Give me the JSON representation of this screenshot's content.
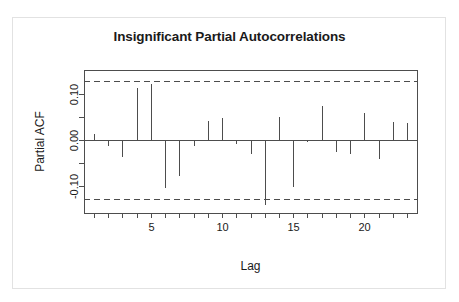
{
  "figure": {
    "background_color": "#ffffff",
    "frame_color": "#e2e2e2",
    "line_color": "#4d4d4d",
    "text_color": "#1a1a1a"
  },
  "chart_data": {
    "type": "bar",
    "title": "Insignificant Partial Autocorrelations",
    "xlabel": "Lag",
    "ylabel": "Partial ACF",
    "xlim": [
      0.3,
      23.7
    ],
    "ylim": [
      -0.158,
      0.152
    ],
    "grid": false,
    "legend": null,
    "x_ticks": [
      5,
      10,
      15,
      20
    ],
    "x_tick_labels": [
      "5",
      "10",
      "15",
      "20"
    ],
    "x_minor_ticks": [
      1,
      2,
      3,
      4,
      6,
      7,
      8,
      9,
      11,
      12,
      13,
      14,
      16,
      17,
      18,
      19,
      21,
      22,
      23
    ],
    "y_ticks": [
      -0.1,
      0.0,
      0.1
    ],
    "y_tick_labels": [
      "-0.10",
      "0.00",
      "0.10"
    ],
    "y_minor_ticks": [
      -0.05,
      0.05
    ],
    "confidence_bounds": {
      "upper": 0.128,
      "lower": -0.128,
      "style": "dashed"
    },
    "categories": [
      1,
      2,
      3,
      4,
      5,
      6,
      7,
      8,
      9,
      10,
      11,
      12,
      13,
      14,
      15,
      16,
      17,
      18,
      19,
      20,
      21,
      22,
      23
    ],
    "values": [
      0.013,
      -0.012,
      -0.037,
      0.114,
      0.122,
      -0.103,
      -0.078,
      -0.012,
      0.042,
      0.049,
      -0.009,
      -0.031,
      -0.14,
      0.05,
      -0.102,
      -0.003,
      0.074,
      -0.025,
      -0.03,
      0.059,
      -0.042,
      0.04,
      0.038
    ]
  }
}
